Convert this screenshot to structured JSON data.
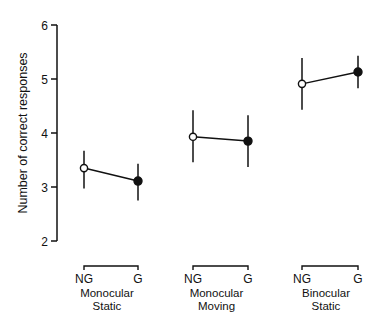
{
  "chart_data": {
    "type": "line",
    "title": "",
    "xlabel": "",
    "ylabel": "Number of correct responses",
    "ylim": [
      2,
      6
    ],
    "yticks": [
      "2",
      "3",
      "4",
      "5",
      "6"
    ],
    "grid": false,
    "legend": null,
    "groups": [
      {
        "label_line1": "Monocular",
        "label_line2": "Static",
        "conditions": [
          "NG",
          "G"
        ],
        "values": [
          3.35,
          3.11
        ],
        "error_low": [
          2.97,
          2.75
        ],
        "error_high": [
          3.67,
          3.43
        ],
        "markers": [
          "open",
          "filled"
        ]
      },
      {
        "label_line1": "Monocular",
        "label_line2": "Moving",
        "conditions": [
          "NG",
          "G"
        ],
        "values": [
          3.93,
          3.85
        ],
        "error_low": [
          3.46,
          3.37
        ],
        "error_high": [
          4.42,
          4.33
        ],
        "markers": [
          "open",
          "filled"
        ]
      },
      {
        "label_line1": "Binocular",
        "label_line2": "Static",
        "conditions": [
          "NG",
          "G"
        ],
        "values": [
          4.91,
          5.13
        ],
        "error_low": [
          4.43,
          4.83
        ],
        "error_high": [
          5.39,
          5.43
        ],
        "markers": [
          "open",
          "filled"
        ]
      }
    ]
  }
}
